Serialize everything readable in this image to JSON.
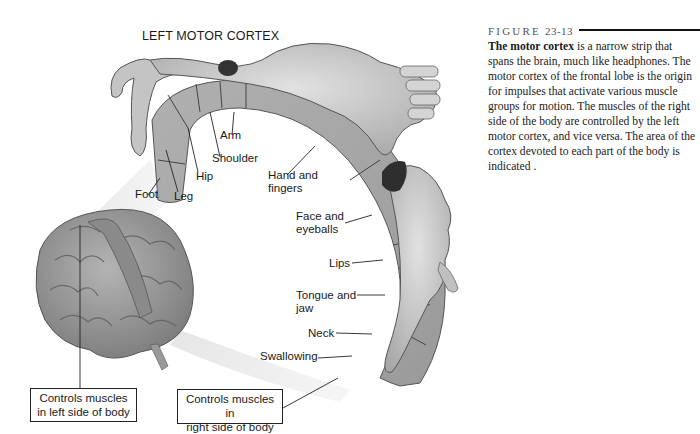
{
  "figure": {
    "title": "LEFT MOTOR CORTEX",
    "labels": {
      "foot": "Foot",
      "leg": "Leg",
      "hip": "Hip",
      "shoulder": "Shoulder",
      "arm": "Arm",
      "hand_fingers_1": "Hand and",
      "hand_fingers_2": "fingers",
      "face_eyeballs_1": "Face and",
      "face_eyeballs_2": "eyeballs",
      "lips": "Lips",
      "tongue_jaw_1": "Tongue and",
      "tongue_jaw_2": "jaw",
      "neck": "Neck",
      "swallowing": "Swallowing"
    },
    "callouts": {
      "left_line1": "Controls muscles",
      "left_line2": "in left side of body",
      "right_line1": "Controls muscles in",
      "right_line2": "right side of body"
    },
    "colors": {
      "cortex_strip": "#a8a8a8",
      "brain": "#9a9a9a",
      "homunculus": "#c8c8c8",
      "outline": "#333333"
    }
  },
  "caption": {
    "label": "FIGURE",
    "number": "23-13",
    "bold_lead": "The motor cortex",
    "text": " is a narrow strip that spans the brain, much like headphones. The motor cortex of the frontal lobe is the origin for impulses that activate various muscle groups for motion. The muscles of the right side of the body are controlled by the left motor cortex, and vice versa. The area of the cortex devoted to each part of the body is indicated ."
  }
}
